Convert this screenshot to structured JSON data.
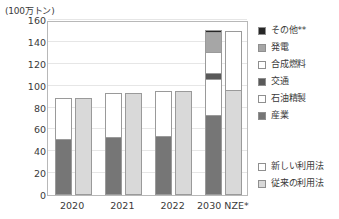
{
  "chart_data": {
    "type": "bar",
    "title": "",
    "subtitle": "",
    "unit_caption": "(100万トン)",
    "xlabel": "",
    "ylabel": "",
    "ylim": [
      0,
      160
    ],
    "yticks": [
      0,
      20,
      40,
      60,
      80,
      100,
      120,
      140,
      160
    ],
    "grid": true,
    "legend_position": "right",
    "categories": [
      "2020",
      "2021",
      "2022",
      "2030 NZE*"
    ],
    "groups": [
      {
        "category": "2020",
        "bars": [
          {
            "usage": "新しい利用法",
            "total": 89,
            "segments": [
              {
                "name": "産業",
                "value": 50
              },
              {
                "name": "石油精製",
                "value": 39
              }
            ]
          },
          {
            "usage": "従来の利用法",
            "total": 89,
            "segments": [
              {
                "name": "従来の利用法",
                "value": 89
              }
            ]
          }
        ]
      },
      {
        "category": "2021",
        "bars": [
          {
            "usage": "新しい利用法",
            "total": 93,
            "segments": [
              {
                "name": "産業",
                "value": 52
              },
              {
                "name": "石油精製",
                "value": 41
              }
            ]
          },
          {
            "usage": "従来の利用法",
            "total": 93,
            "segments": [
              {
                "name": "従来の利用法",
                "value": 93
              }
            ]
          }
        ]
      },
      {
        "category": "2022",
        "bars": [
          {
            "usage": "新しい利用法",
            "total": 95,
            "segments": [
              {
                "name": "産業",
                "value": 53
              },
              {
                "name": "石油精製",
                "value": 42
              }
            ]
          },
          {
            "usage": "従来の利用法",
            "total": 95,
            "segments": [
              {
                "name": "従来の利用法",
                "value": 95
              }
            ]
          }
        ]
      },
      {
        "category": "2030 NZE*",
        "bars": [
          {
            "usage": "新しい利用法",
            "total": 151,
            "segments": [
              {
                "name": "産業",
                "value": 72
              },
              {
                "name": "石油精製",
                "value": 33
              },
              {
                "name": "交通",
                "value": 6
              },
              {
                "name": "合成燃料",
                "value": 19
              },
              {
                "name": "発電",
                "value": 18
              },
              {
                "name": "その他**",
                "value": 3
              }
            ]
          },
          {
            "usage": "従来の利用法",
            "total": 150,
            "segments": [
              {
                "name": "従来の利用法",
                "value": 95
              },
              {
                "name": "新しい利用法",
                "value": 55
              }
            ]
          }
        ]
      }
    ],
    "series": [
      {
        "name": "その他**",
        "values": [
          0,
          0,
          0,
          3
        ]
      },
      {
        "name": "発電",
        "values": [
          0,
          0,
          0,
          18
        ]
      },
      {
        "name": "合成燃料",
        "values": [
          0,
          0,
          0,
          19
        ]
      },
      {
        "name": "交通",
        "values": [
          0,
          0,
          0,
          6
        ]
      },
      {
        "name": "石油精製",
        "values": [
          39,
          41,
          42,
          33
        ]
      },
      {
        "name": "産業",
        "values": [
          50,
          52,
          53,
          72
        ]
      }
    ]
  },
  "legend_main": {
    "items": [
      {
        "label": "その他**",
        "color": "#262626"
      },
      {
        "label": "発電",
        "color": "#a6a6a6"
      },
      {
        "label": "合成燃料",
        "color": "#ffffff"
      },
      {
        "label": "交通",
        "color": "#595959"
      },
      {
        "label": "石油精製",
        "color": "#ffffff"
      },
      {
        "label": "産業",
        "color": "#767676"
      }
    ]
  },
  "legend_secondary": {
    "items": [
      {
        "label": "新しい利用法",
        "color": "#ffffff"
      },
      {
        "label": "従来の利用法",
        "color": "#d9d9d9"
      }
    ]
  },
  "colors": {
    "other": "#262626",
    "power": "#a6a6a6",
    "synthetic_fuel": "#ffffff",
    "transport": "#595959",
    "refining": "#ffffff",
    "industry": "#767676",
    "conventional": "#d9d9d9",
    "stroke": "#9a9a9a",
    "gridline": "#e6e6e6",
    "axis": "#b8b8b8",
    "text": "#3a3a3a"
  }
}
